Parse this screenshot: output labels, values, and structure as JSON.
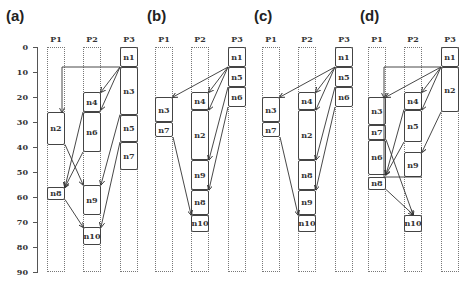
{
  "axis": {
    "ticks": [
      "0",
      "10",
      "20",
      "30",
      "40",
      "50",
      "60",
      "70",
      "80",
      "90"
    ],
    "y0_px": 47,
    "px_per_unit": 2.5
  },
  "processors": [
    "P1",
    "P2",
    "P3"
  ],
  "panels": [
    {
      "label": "(a)",
      "x0": 47,
      "tasks": [
        {
          "name": "n1",
          "lane": 2,
          "start": 0,
          "end": 8
        },
        {
          "name": "n3",
          "lane": 2,
          "start": 8,
          "end": 27
        },
        {
          "name": "n5",
          "lane": 2,
          "start": 27,
          "end": 38
        },
        {
          "name": "n7",
          "lane": 2,
          "start": 38,
          "end": 49
        },
        {
          "name": "n4",
          "lane": 1,
          "start": 18,
          "end": 26
        },
        {
          "name": "n6",
          "lane": 1,
          "start": 26,
          "end": 42
        },
        {
          "name": "n9",
          "lane": 1,
          "start": 55,
          "end": 67
        },
        {
          "name": "n10",
          "lane": 1,
          "start": 72,
          "end": 79
        },
        {
          "name": "n2",
          "lane": 0,
          "start": 26,
          "end": 39
        },
        {
          "name": "n8",
          "lane": 0,
          "start": 56,
          "end": 61
        }
      ]
    },
    {
      "label": "(b)",
      "x0": 155,
      "tasks": [
        {
          "name": "n1",
          "lane": 2,
          "start": 0,
          "end": 8
        },
        {
          "name": "n5",
          "lane": 2,
          "start": 8,
          "end": 16
        },
        {
          "name": "n6",
          "lane": 2,
          "start": 16,
          "end": 24
        },
        {
          "name": "n3",
          "lane": 0,
          "start": 20,
          "end": 30
        },
        {
          "name": "n7",
          "lane": 0,
          "start": 30,
          "end": 36
        },
        {
          "name": "n4",
          "lane": 1,
          "start": 18,
          "end": 25
        },
        {
          "name": "n2",
          "lane": 1,
          "start": 25,
          "end": 45
        },
        {
          "name": "n9",
          "lane": 1,
          "start": 45,
          "end": 57
        },
        {
          "name": "n8",
          "lane": 1,
          "start": 57,
          "end": 67
        },
        {
          "name": "n10",
          "lane": 1,
          "start": 67,
          "end": 74
        }
      ]
    },
    {
      "label": "(c)",
      "x0": 262,
      "tasks": [
        {
          "name": "n1",
          "lane": 2,
          "start": 0,
          "end": 8
        },
        {
          "name": "n5",
          "lane": 2,
          "start": 8,
          "end": 16
        },
        {
          "name": "n6",
          "lane": 2,
          "start": 16,
          "end": 24
        },
        {
          "name": "n3",
          "lane": 0,
          "start": 20,
          "end": 30
        },
        {
          "name": "n7",
          "lane": 0,
          "start": 30,
          "end": 36
        },
        {
          "name": "n4",
          "lane": 1,
          "start": 18,
          "end": 25
        },
        {
          "name": "n2",
          "lane": 1,
          "start": 25,
          "end": 45
        },
        {
          "name": "n8",
          "lane": 1,
          "start": 45,
          "end": 57
        },
        {
          "name": "n9",
          "lane": 1,
          "start": 57,
          "end": 67
        },
        {
          "name": "n10",
          "lane": 1,
          "start": 67,
          "end": 74
        }
      ]
    },
    {
      "label": "(d)",
      "x0": 368,
      "tasks": [
        {
          "name": "n1",
          "lane": 2,
          "start": 0,
          "end": 8
        },
        {
          "name": "n2",
          "lane": 2,
          "start": 8,
          "end": 26
        },
        {
          "name": "n3",
          "lane": 0,
          "start": 20,
          "end": 31
        },
        {
          "name": "n7",
          "lane": 0,
          "start": 31,
          "end": 37
        },
        {
          "name": "n6",
          "lane": 0,
          "start": 37,
          "end": 51
        },
        {
          "name": "n8",
          "lane": 0,
          "start": 52,
          "end": 57
        },
        {
          "name": "n4",
          "lane": 1,
          "start": 18,
          "end": 25
        },
        {
          "name": "n5",
          "lane": 1,
          "start": 25,
          "end": 38
        },
        {
          "name": "n9",
          "lane": 1,
          "start": 42,
          "end": 52
        },
        {
          "name": "n10",
          "lane": 1,
          "start": 67,
          "end": 74
        }
      ]
    }
  ]
}
